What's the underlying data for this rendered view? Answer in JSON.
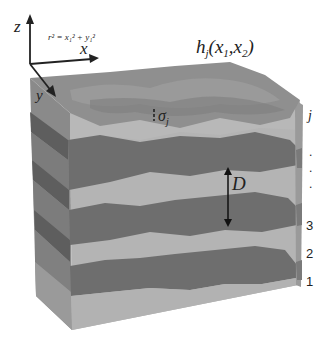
{
  "diagram": {
    "axes": {
      "z_label": "z",
      "x_label": "x",
      "y_label": "y",
      "formula": "r² = x₁² + y₁²"
    },
    "surface_label": {
      "h": "h",
      "sub": "j",
      "args": "(x",
      "arg1_sub": "1",
      "mid": ",x",
      "arg2_sub": "2",
      "close": ")"
    },
    "sigma_label": {
      "symbol": "σ",
      "sub": "j"
    },
    "spacing_label": "D",
    "layer_labels": [
      "j",
      ".",
      ".",
      ".",
      "3",
      "2",
      "1"
    ],
    "colors": {
      "light_layer": "#b4b4b4",
      "dark_layer": "#6e6e6e",
      "top_surface": "#8c8c8c",
      "side_light": "#a0a0a0",
      "side_dark": "#5e5e5e",
      "text": "#222222"
    }
  }
}
